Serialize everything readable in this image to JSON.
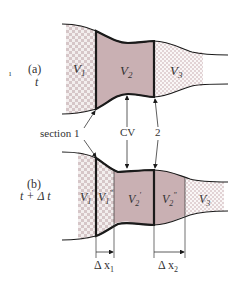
{
  "colors": {
    "outline": "#1a1a1a",
    "cv_fill": "#c9b0b3",
    "check_a": "#d6c6c8",
    "check_b": "#f3eeee",
    "fine_check_a": "#e2d3d5",
    "fine_check_b": "#faf7f7",
    "text": "#333333"
  },
  "panel_a": {
    "label": "(a)",
    "time": "t",
    "stray_mark": "ı",
    "regions": {
      "v1": {
        "symbol": "V",
        "subscript": "1"
      },
      "v2": {
        "symbol": "V",
        "subscript": "2"
      },
      "v3": {
        "symbol": "V",
        "subscript": "3"
      }
    }
  },
  "annotations": {
    "section1": "section 1",
    "cv": "CV",
    "section2": "2"
  },
  "panel_b": {
    "label": "(b)",
    "time": "t + Δ t",
    "regions": {
      "v1p": {
        "symbol": "V",
        "subscript": "1",
        "prime": "′"
      },
      "v1pp": {
        "symbol": "V",
        "subscript": "1",
        "prime": "″"
      },
      "v2p": {
        "symbol": "V",
        "subscript": "2",
        "prime": "′"
      },
      "v2pp": {
        "symbol": "V",
        "subscript": "2",
        "prime": "″"
      },
      "v3": {
        "symbol": "V",
        "subscript": "3"
      }
    },
    "dimensions": {
      "dx1": {
        "symbol": "Δ x",
        "subscript": "1"
      },
      "dx2": {
        "symbol": "Δ x",
        "subscript": "2"
      }
    }
  }
}
